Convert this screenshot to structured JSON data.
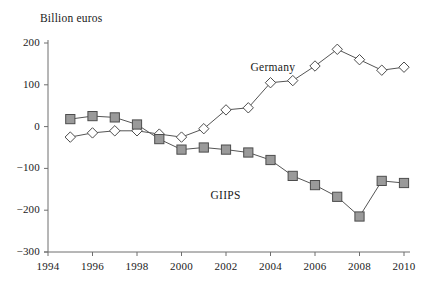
{
  "chart_data": {
    "type": "line",
    "title": "",
    "ylabel": "Billion euros",
    "xlabel": "",
    "ylim": [
      -300,
      200
    ],
    "xlim": [
      1994,
      2010
    ],
    "ytick_values": [
      200,
      100,
      0,
      -100,
      -200,
      -300
    ],
    "ytick_labels": [
      "200",
      "100",
      "0",
      "−100",
      "−200",
      "−300"
    ],
    "xtick_values": [
      1994,
      1996,
      1998,
      2000,
      2002,
      2004,
      2006,
      2008,
      2010
    ],
    "xtick_labels": [
      "1994",
      "1996",
      "1998",
      "2000",
      "2002",
      "2004",
      "2006",
      "2008",
      "2010"
    ],
    "grid": false,
    "legend_position": "inline-annotation",
    "x": [
      1995,
      1996,
      1997,
      1998,
      1999,
      2000,
      2001,
      2002,
      2003,
      2004,
      2005,
      2006,
      2007,
      2008,
      2009,
      2010
    ],
    "series": [
      {
        "name": "Germany",
        "marker": "diamond-open",
        "color": "#ffffff",
        "line_color": "#555555",
        "values": [
          -25,
          -15,
          -10,
          -10,
          -18,
          -25,
          -5,
          40,
          45,
          105,
          110,
          145,
          185,
          160,
          135,
          142
        ]
      },
      {
        "name": "GIIPS",
        "marker": "square-filled",
        "color": "#9a9a9a",
        "line_color": "#555555",
        "values": [
          18,
          25,
          22,
          5,
          -30,
          -55,
          -50,
          -55,
          -62,
          -80,
          -118,
          -140,
          -168,
          -215,
          -130,
          -135
        ]
      }
    ],
    "annotations": [
      {
        "text": "Germany",
        "x": 2003.1,
        "y": 138
      },
      {
        "text": "GIIPS",
        "x": 2001.3,
        "y": -168
      }
    ]
  }
}
